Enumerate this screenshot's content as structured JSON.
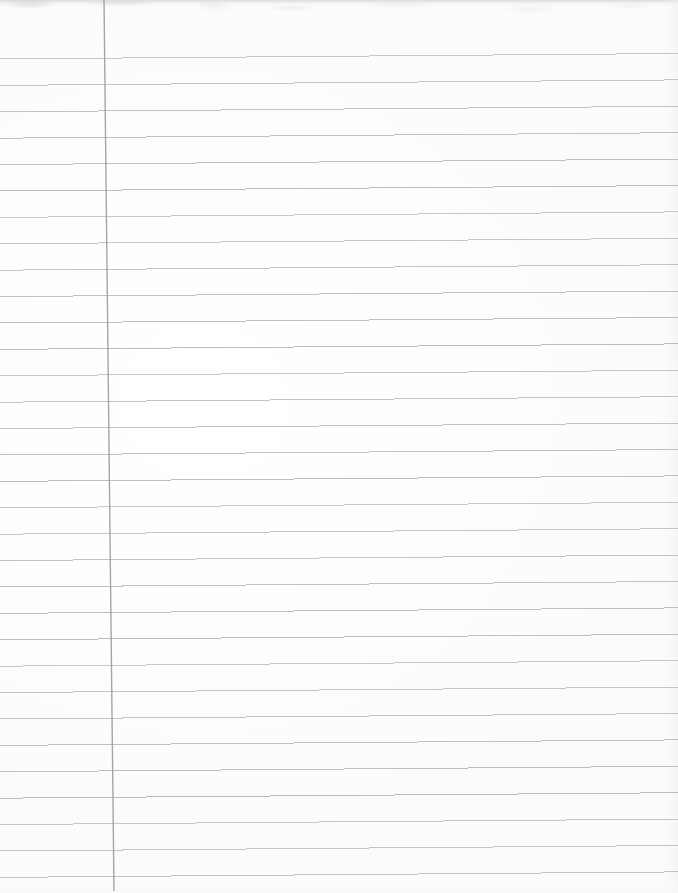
{
  "document": {
    "kind": "scanned-lined-notebook-paper",
    "title": "Blank Ruled Notebook Page",
    "page_width": 678,
    "page_height": 893,
    "content_text": "",
    "is_blank": true,
    "orientation": "portrait"
  },
  "colors": {
    "page_background": "#fefefe",
    "paper_tone": "#fdfdfd",
    "rule_line": "#b9bcc0",
    "rule_line_faint": "#c8cacd",
    "margin_line": "#9b9ea3",
    "scan_edge_shadow": "#a8aaae"
  },
  "ruling": {
    "type": "college-ruled-horizontal",
    "line_count": 32,
    "first_line_y": 59,
    "line_spacing": 26.4,
    "left_x": 0,
    "right_x": 678,
    "right_rise_px": 5.5,
    "stroke_color": "#b9bcc0",
    "stroke_width": 1,
    "y_positions": [
      59,
      85.4,
      111.8,
      138.2,
      164.6,
      191,
      217.4,
      243.8,
      270.2,
      296.6,
      323,
      349.4,
      375.8,
      402.2,
      428.6,
      455,
      481.4,
      507.8,
      534.2,
      560.6,
      587,
      613.4,
      639.8,
      666.2,
      692.6,
      719,
      745.4,
      771.8,
      798.2,
      824.6,
      851,
      877.4
    ]
  },
  "margin_rule": {
    "type": "vertical-margin-line",
    "top_x": 104,
    "bottom_x": 114,
    "top_y": 0,
    "bottom_y": 891,
    "stroke_color": "#9b9ea3",
    "stroke_width": 1.4
  }
}
